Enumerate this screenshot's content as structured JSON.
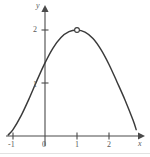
{
  "figure": {
    "background": "#ffffff",
    "ink_color": "#3a3a3a",
    "label_color": "#5a5a5a"
  },
  "axes": {
    "x_label": "x",
    "y_label": "y",
    "x_ticks": [
      "-1",
      "0",
      "1",
      "2"
    ],
    "y_ticks": [
      "1",
      "2"
    ]
  },
  "chart_data": {
    "type": "line",
    "title": "",
    "xlabel": "x",
    "ylabel": "y",
    "xlim": [
      -1.25,
      2.9
    ],
    "ylim": [
      -0.05,
      2.45
    ],
    "grid": false,
    "legend": null,
    "xticks": [
      -1,
      0,
      1,
      2
    ],
    "xticklabels": [
      "-1",
      "0",
      "1",
      "2"
    ],
    "yticks": [
      1,
      2
    ],
    "yticklabels": [
      "1",
      "2"
    ],
    "series": [
      {
        "name": "curve",
        "style": "solid",
        "color": "#3a3a3a",
        "x": [
          -1.15,
          -1.0,
          -0.75,
          -0.5,
          -0.25,
          0.0,
          0.25,
          0.5,
          0.75,
          1.0,
          1.25,
          1.5,
          1.75,
          2.0,
          2.25,
          2.5,
          2.75,
          2.85
        ],
        "y": [
          0.02,
          0.12,
          0.38,
          0.7,
          1.05,
          1.38,
          1.66,
          1.86,
          1.97,
          2.0,
          1.96,
          1.84,
          1.63,
          1.35,
          1.02,
          0.68,
          0.3,
          0.12
        ]
      }
    ],
    "markers": [
      {
        "name": "vertex-open-circle",
        "x": 1.0,
        "y": 2.0,
        "style": "open-circle",
        "fill": "#ffffff",
        "stroke": "#3a3a3a"
      }
    ],
    "annotations": []
  }
}
